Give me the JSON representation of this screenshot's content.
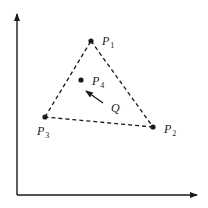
{
  "diagram": {
    "type": "triangle-with-interior-point",
    "colors": {
      "ink": "#1a1a1a",
      "background": "#ffffff"
    },
    "axes": {
      "origin": [
        17,
        195
      ],
      "y_axis_top": [
        17,
        14
      ],
      "x_axis_right": [
        197,
        195
      ]
    },
    "points": [
      {
        "id": "P1",
        "letter": "P",
        "subscript": "1",
        "x": 91,
        "y": 41,
        "label_x": 102,
        "label_y": 45
      },
      {
        "id": "P2",
        "letter": "P",
        "subscript": "2",
        "x": 153,
        "y": 127,
        "label_x": 164,
        "label_y": 133
      },
      {
        "id": "P3",
        "letter": "P",
        "subscript": "3",
        "x": 45,
        "y": 117,
        "label_x": 37,
        "label_y": 135
      },
      {
        "id": "P4",
        "letter": "P",
        "subscript": "4",
        "x": 81,
        "y": 80,
        "label_x": 92,
        "label_y": 85
      }
    ],
    "triangle_edges": [
      [
        "P1",
        "P2"
      ],
      [
        "P2",
        "P3"
      ],
      [
        "P3",
        "P1"
      ]
    ],
    "query": {
      "label": "Q",
      "label_x": 111,
      "label_y": 112,
      "arrow_from": [
        103,
        103
      ],
      "arrow_to": [
        86,
        91
      ]
    }
  }
}
